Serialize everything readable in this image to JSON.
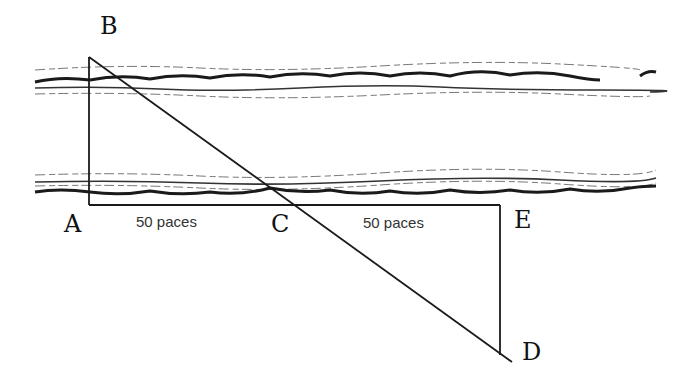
{
  "diagram": {
    "type": "geometry-river-width-measurement",
    "points": {
      "A": {
        "label": "A",
        "x": 89,
        "y": 205
      },
      "B": {
        "label": "B",
        "x": 89,
        "y": 57
      },
      "C": {
        "label": "C",
        "x": 293,
        "y": 205
      },
      "D": {
        "label": "D",
        "x": 510,
        "y": 360
      },
      "E": {
        "label": "E",
        "x": 500,
        "y": 205
      }
    },
    "segments": {
      "AC": {
        "label": "50 paces"
      },
      "CE": {
        "label": "50 paces"
      }
    },
    "colors": {
      "ink": "#1a1a1a",
      "background": "#ffffff",
      "text": "#333333"
    }
  }
}
